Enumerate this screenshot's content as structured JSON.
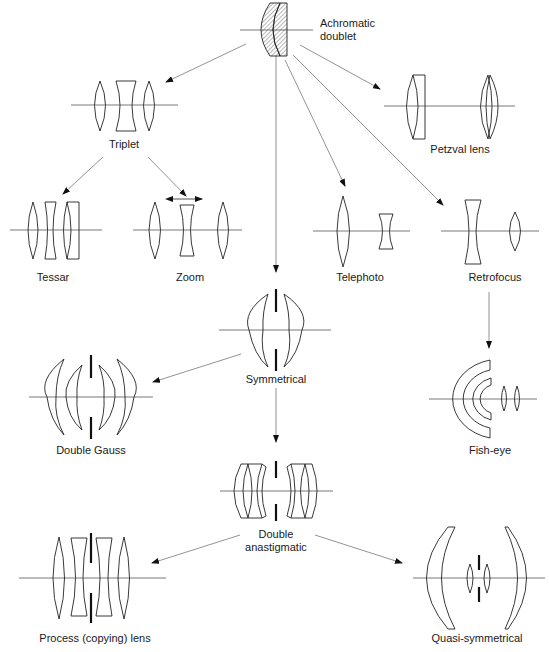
{
  "diagram": {
    "nodes": {
      "achromatic": {
        "label_line1": "Achromatic",
        "label_line2": "doublet"
      },
      "triplet": {
        "label": "Triplet"
      },
      "petzval": {
        "label": "Petzval lens"
      },
      "tessar": {
        "label": "Tessar"
      },
      "zoom": {
        "label": "Zoom"
      },
      "telephoto": {
        "label": "Telephoto"
      },
      "retrofocus": {
        "label": "Retrofocus"
      },
      "symmetrical": {
        "label": "Symmetrical"
      },
      "double_gauss": {
        "label": "Double Gauss"
      },
      "fisheye": {
        "label": "Fish-eye"
      },
      "double_anastigmatic": {
        "label_line1": "Double",
        "label_line2": "anastigmatic"
      },
      "process": {
        "label": "Process (copying) lens"
      },
      "quasi": {
        "label": "Quasi-symmetrical"
      }
    },
    "edges": [
      {
        "from": "Achromatic doublet",
        "to": "Triplet"
      },
      {
        "from": "Achromatic doublet",
        "to": "Petzval lens"
      },
      {
        "from": "Achromatic doublet",
        "to": "Symmetrical"
      },
      {
        "from": "Achromatic doublet",
        "to": "Telephoto"
      },
      {
        "from": "Achromatic doublet",
        "to": "Retrofocus"
      },
      {
        "from": "Triplet",
        "to": "Tessar"
      },
      {
        "from": "Triplet",
        "to": "Zoom"
      },
      {
        "from": "Retrofocus",
        "to": "Fish-eye"
      },
      {
        "from": "Symmetrical",
        "to": "Double Gauss"
      },
      {
        "from": "Symmetrical",
        "to": "Double anastigmatic"
      },
      {
        "from": "Double anastigmatic",
        "to": "Process (copying) lens"
      },
      {
        "from": "Double anastigmatic",
        "to": "Quasi-symmetrical"
      }
    ],
    "colors": {
      "line": "#222222",
      "arrow": "#777777",
      "axis": "#555555"
    }
  }
}
